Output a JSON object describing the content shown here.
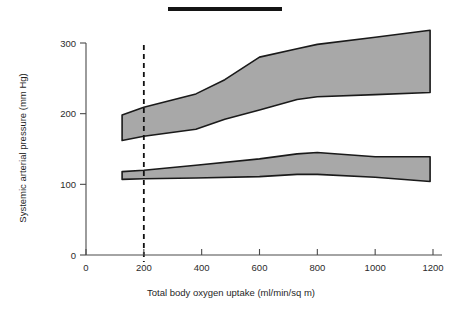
{
  "figure": {
    "background_color": "#ffffff",
    "band_fill_color": "#a8a8a8",
    "band_outline_color": "#1a1a1a",
    "axis_color": "#4a4a4a",
    "marker_bar_color": "#141414",
    "marker_bar_name": "top-black-rule"
  },
  "chart_data": {
    "type": "area",
    "title": "",
    "subtitle": "",
    "xlabel": "Total body oxygen uptake (ml/min/sq m)",
    "ylabel": "Systemic arterial pressure (mm Hg)",
    "xlim": [
      0,
      1200
    ],
    "ylim": [
      0,
      320
    ],
    "xticks": [
      0,
      200,
      400,
      600,
      800,
      1000,
      1200
    ],
    "xtick_labels": [
      "0",
      "200",
      "400",
      "600",
      "800",
      "1000",
      "1200"
    ],
    "yticks": [
      0,
      100,
      200,
      300
    ],
    "ytick_labels": [
      "0",
      "100",
      "200",
      "300"
    ],
    "grid": false,
    "legend": null,
    "legend_position": "none",
    "annotations": [
      {
        "name": "reference-line-200",
        "type": "vertical-dashed-line",
        "x": 200,
        "label": ""
      }
    ],
    "series": [
      {
        "name": "Systolic pressure range (upper band)",
        "kind": "band",
        "x": [
          125,
          200,
          380,
          480,
          600,
          730,
          800,
          1000,
          1190
        ],
        "upper": [
          198,
          209,
          228,
          248,
          280,
          292,
          298,
          308,
          318
        ],
        "lower": [
          162,
          168,
          178,
          192,
          205,
          220,
          224,
          227,
          230
        ]
      },
      {
        "name": "Diastolic pressure range (lower band)",
        "kind": "band",
        "x": [
          125,
          200,
          380,
          600,
          730,
          800,
          1000,
          1190
        ],
        "upper": [
          118,
          120,
          127,
          136,
          143,
          145,
          139,
          139
        ],
        "lower": [
          107,
          108,
          109,
          111,
          114,
          114,
          110,
          104
        ]
      }
    ]
  }
}
